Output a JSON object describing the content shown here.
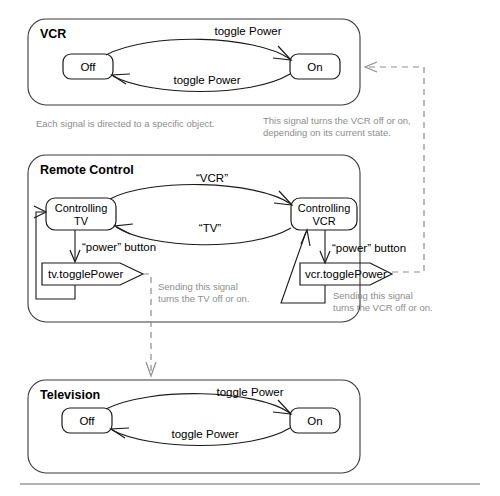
{
  "diagram": {
    "rule_label": "",
    "frames": {
      "vcr": {
        "title": "VCR",
        "states": [
          {
            "id": "vcr-off",
            "label": "Off"
          },
          {
            "id": "vcr-on",
            "label": "On"
          }
        ],
        "transitions": [
          {
            "id": "vcr-off-to-on",
            "label": "toggle Power"
          },
          {
            "id": "vcr-on-to-off",
            "label": "toggle Power"
          }
        ]
      },
      "remote": {
        "title": "Remote Control",
        "states": [
          {
            "id": "controlling-tv",
            "line1": "Controlling",
            "line2": "TV"
          },
          {
            "id": "controlling-vcr",
            "line1": "Controlling",
            "line2": "VCR"
          }
        ],
        "transitions": [
          {
            "id": "tv-to-vcr",
            "label": "“VCR”"
          },
          {
            "id": "vcr-to-tv",
            "label": "“TV”"
          },
          {
            "id": "tv-power-button",
            "label": "“power” button"
          },
          {
            "id": "vcr-power-button",
            "label": "“power” button"
          }
        ],
        "signals": [
          {
            "id": "tv-toggle-power",
            "label": "tv.togglePower"
          },
          {
            "id": "vcr-toggle-power",
            "label": "vcr.togglePower"
          }
        ]
      },
      "television": {
        "title": "Television",
        "states": [
          {
            "id": "tv-off",
            "label": "Off"
          },
          {
            "id": "tv-on",
            "label": "On"
          }
        ],
        "transitions": [
          {
            "id": "tv-off-to-on",
            "label": "toggle Power"
          },
          {
            "id": "tv-on-to-off",
            "label": "toggle Power"
          }
        ]
      }
    },
    "notes": [
      {
        "id": "note-each-signal",
        "lines": [
          "Each signal is directed to a specific object."
        ]
      },
      {
        "id": "note-vcr-signal",
        "lines": [
          "This signal turns the VCR off or on,",
          "depending on its current state."
        ]
      },
      {
        "id": "note-sending-tv",
        "lines": [
          "Sending this signal",
          "turns the TV off or on."
        ]
      },
      {
        "id": "note-sending-vcr",
        "lines": [
          "Sending this signal",
          "turns the VCR off or on."
        ]
      }
    ],
    "colors": {
      "ink": "#1a1a1a",
      "frame": "#3a3a3a",
      "note": "#8d8d8d",
      "dashed": "#8d8d8d",
      "background": "#ffffff"
    }
  }
}
